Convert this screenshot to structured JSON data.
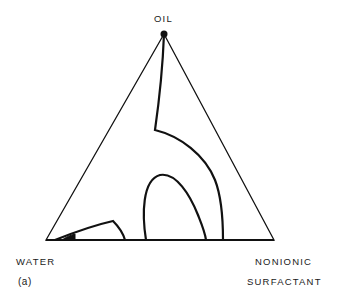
{
  "diagram": {
    "type": "ternary-phase-diagram",
    "panel_label": "(a)",
    "vertices": {
      "top": "OIL",
      "bottom_left": "WATER",
      "bottom_right_line1": "NONIONIC",
      "bottom_right_line2": "SURFACTANT"
    },
    "regions": [
      {
        "name": "outer-phase-boundary",
        "description": "Curve from OIL vertex down then arcing to base near surfactant side"
      },
      {
        "name": "inner-arch-region",
        "description": "Arch-shaped region on base between water and surfactant"
      },
      {
        "name": "water-side-lobe",
        "description": "Low lobe near the WATER vertex"
      },
      {
        "name": "small-filled-region",
        "description": "Tiny shaded region near WATER corner"
      }
    ],
    "colors": {
      "line": "#111111",
      "background": "#ffffff"
    }
  }
}
